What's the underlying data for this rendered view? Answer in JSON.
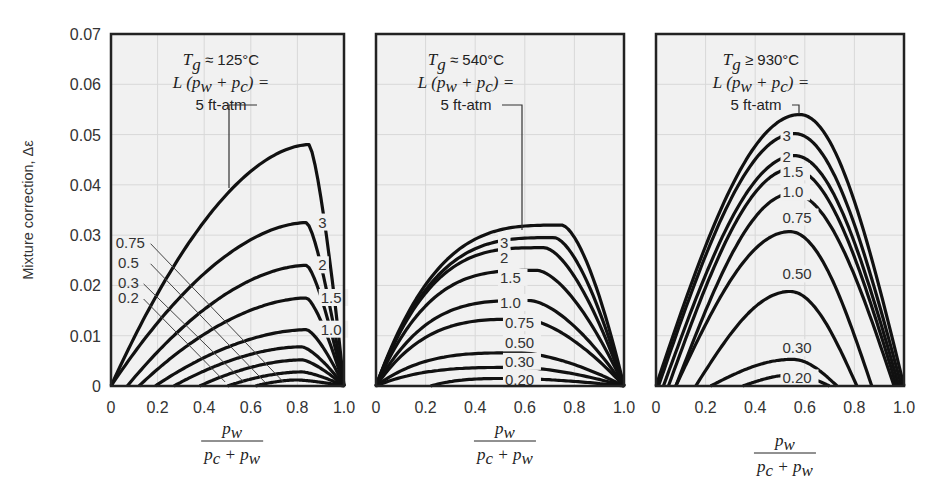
{
  "figure": {
    "ylabel": "Mixture correction, Δε",
    "xlabel_numerator": "p_w",
    "xlabel_denominator": "p_c + p_w",
    "y_ticks": [
      "0",
      "0.01",
      "0.02",
      "0.03",
      "0.04",
      "0.05",
      "0.06",
      "0.07"
    ],
    "x_ticks": [
      "0",
      "0.2",
      "0.4",
      "0.6",
      "0.8",
      "1.0"
    ],
    "colors": {
      "background": "#f1f1f1",
      "curve": "#111111",
      "frame": "#222222",
      "grid": "#d8d8d8",
      "text": "#333333"
    }
  },
  "chart_data": [
    {
      "type": "line",
      "title": "Tg ≈ 125°C",
      "annotation": [
        "Tg ≈ 125°C",
        "L (pw + pc) =",
        "5 ft-atm"
      ],
      "xlabel": "pw / (pc + pw)",
      "ylabel": "Mixture correction, Δε",
      "xlim": [
        0,
        1.0
      ],
      "ylim": [
        0,
        0.07
      ],
      "series_param": "L(pw + pc), ft-atm",
      "series": [
        {
          "name": "5",
          "start": 0.0,
          "peak_x": 0.85,
          "peak": 0.048
        },
        {
          "name": "3",
          "start": 0.0,
          "peak_x": 0.84,
          "peak": 0.0325
        },
        {
          "name": "2",
          "start": 0.07,
          "peak_x": 0.84,
          "peak": 0.024
        },
        {
          "name": "1.5",
          "start": 0.12,
          "peak_x": 0.84,
          "peak": 0.0175
        },
        {
          "name": "1.0",
          "start": 0.19,
          "peak_x": 0.84,
          "peak": 0.0112
        },
        {
          "name": "0.75",
          "start": 0.27,
          "peak_x": 0.82,
          "peak": 0.0078
        },
        {
          "name": "0.5",
          "start": 0.38,
          "peak_x": 0.82,
          "peak": 0.0052
        },
        {
          "name": "0.3",
          "start": 0.5,
          "peak_x": 0.82,
          "peak": 0.0028
        },
        {
          "name": "0.2",
          "start": 0.62,
          "peak_x": 0.8,
          "peak": 0.0012
        }
      ],
      "labels": [
        {
          "text": "3",
          "x": 0.89,
          "y": 0.0325
        },
        {
          "text": "2",
          "x": 0.89,
          "y": 0.024
        },
        {
          "text": "1.5",
          "x": 0.9,
          "y": 0.0175
        },
        {
          "text": "1.0",
          "x": 0.9,
          "y": 0.0112
        },
        {
          "text": "0.75",
          "x": 0.02,
          "y": 0.0285
        },
        {
          "text": "0.5",
          "x": 0.03,
          "y": 0.0245
        },
        {
          "text": "0.3",
          "x": 0.03,
          "y": 0.0205
        },
        {
          "text": "0.2",
          "x": 0.03,
          "y": 0.0175
        }
      ]
    },
    {
      "type": "line",
      "title": "Tg ≈ 540°C",
      "annotation": [
        "Tg ≈ 540°C",
        "L (pw + pc) =",
        "5 ft-atm"
      ],
      "xlabel": "pw / (pc + pw)",
      "xlim": [
        0,
        1.0
      ],
      "ylim": [
        0,
        0.07
      ],
      "series_param": "L(pw + pc), ft-atm",
      "series": [
        {
          "name": "5",
          "start": 0.0,
          "peak_x": 0.75,
          "peak": 0.032
        },
        {
          "name": "3",
          "start": 0.0,
          "peak_x": 0.72,
          "peak": 0.0295
        },
        {
          "name": "2",
          "start": 0.0,
          "peak_x": 0.68,
          "peak": 0.0275
        },
        {
          "name": "1.5",
          "start": 0.0,
          "peak_x": 0.65,
          "peak": 0.023
        },
        {
          "name": "1.0",
          "start": 0.0,
          "peak_x": 0.62,
          "peak": 0.017
        },
        {
          "name": "0.75",
          "start": 0.0,
          "peak_x": 0.6,
          "peak": 0.0133
        },
        {
          "name": "0.50",
          "start": 0.0,
          "peak_x": 0.58,
          "peak": 0.0066
        },
        {
          "name": "0.30",
          "start": 0.0,
          "peak_x": 0.58,
          "peak": 0.0037
        },
        {
          "name": "0.20",
          "start": 0.22,
          "peak_x": 0.55,
          "peak": 0.0015
        }
      ],
      "labels": [
        {
          "text": "3",
          "x": 0.5,
          "y": 0.0285
        },
        {
          "text": "2",
          "x": 0.5,
          "y": 0.0255
        },
        {
          "text": "1.5",
          "x": 0.5,
          "y": 0.0215
        },
        {
          "text": "1.0",
          "x": 0.5,
          "y": 0.0165
        },
        {
          "text": "0.75",
          "x": 0.52,
          "y": 0.0125
        },
        {
          "text": "0.50",
          "x": 0.52,
          "y": 0.0085
        },
        {
          "text": "0.30",
          "x": 0.52,
          "y": 0.0048
        },
        {
          "text": "0.20",
          "x": 0.52,
          "y": 0.0012
        }
      ]
    },
    {
      "type": "line",
      "title": "Tg ≥ 930°C",
      "annotation": [
        "Tg ≥ 930°C",
        "L (pw + pc) =",
        "5 ft-atm"
      ],
      "xlabel": "pw / (pc + pw)",
      "xlim": [
        0,
        1.0
      ],
      "ylim": [
        0,
        0.07
      ],
      "series_param": "L(pw + pc), ft-atm",
      "series": [
        {
          "name": "5",
          "start": 0.0,
          "end": 1.0,
          "peak_x": 0.58,
          "peak": 0.054
        },
        {
          "name": "3",
          "start": 0.01,
          "end": 0.99,
          "peak_x": 0.56,
          "peak": 0.0502
        },
        {
          "name": "2",
          "start": 0.03,
          "end": 0.98,
          "peak_x": 0.56,
          "peak": 0.0458
        },
        {
          "name": "1.5",
          "start": 0.05,
          "end": 0.97,
          "peak_x": 0.55,
          "peak": 0.0432
        },
        {
          "name": "1.0",
          "start": 0.08,
          "end": 0.96,
          "peak_x": 0.55,
          "peak": 0.0383
        },
        {
          "name": "0.75",
          "start": 0.08,
          "end": 0.87,
          "peak_x": 0.54,
          "peak": 0.0307
        },
        {
          "name": "0.50",
          "start": 0.16,
          "end": 0.81,
          "peak_x": 0.54,
          "peak": 0.0188
        },
        {
          "name": "0.30",
          "start": 0.22,
          "end": 0.73,
          "peak_x": 0.55,
          "peak": 0.0053
        },
        {
          "name": "0.20",
          "start": 0.35,
          "end": 0.7,
          "peak_x": 0.55,
          "peak": 0.0022
        }
      ],
      "labels": [
        {
          "text": "3",
          "x": 0.51,
          "y": 0.0497
        },
        {
          "text": "2",
          "x": 0.51,
          "y": 0.0455
        },
        {
          "text": "1.5",
          "x": 0.51,
          "y": 0.0425
        },
        {
          "text": "1.0",
          "x": 0.51,
          "y": 0.0385
        },
        {
          "text": "0.75",
          "x": 0.51,
          "y": 0.0335
        },
        {
          "text": "0.50",
          "x": 0.51,
          "y": 0.0222
        },
        {
          "text": "0.30",
          "x": 0.51,
          "y": 0.0075
        },
        {
          "text": "0.20",
          "x": 0.51,
          "y": 0.0015
        }
      ]
    }
  ]
}
